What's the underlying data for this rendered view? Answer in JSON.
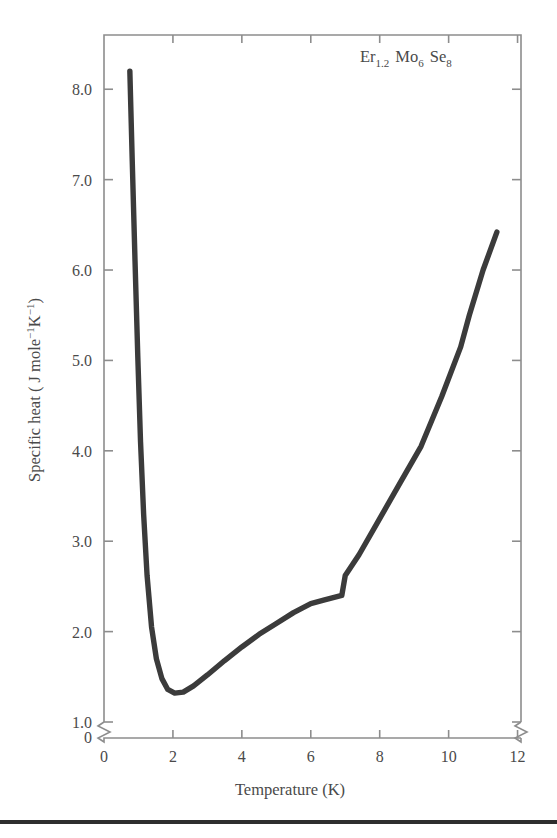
{
  "figure": {
    "annotation": "Er1.2 Mo6 Se8",
    "annotation_parts": {
      "e1": "Er",
      "e1_sub": "1.2",
      "e2": "Mo",
      "e2_sub": "6",
      "e3": "Se",
      "e3_sub": "8"
    }
  },
  "axes": {
    "x_title": "Temperature (K)",
    "y_title_main": "Specific heat ( J mole",
    "y_title_sup1": "−1",
    "y_title_mid": "K",
    "y_title_sup2": "−1",
    "y_title_end": ")",
    "x_tick_labels": [
      "0",
      "2",
      "4",
      "6",
      "8",
      "10",
      "12"
    ],
    "y_tick_labels": [
      "0",
      "1.0",
      "2.0",
      "3.0",
      "4.0",
      "5.0",
      "6.0",
      "7.0",
      "8.0"
    ],
    "y_break_between": [
      "0",
      "1.0"
    ],
    "x_break_note": "right axis break near 12"
  },
  "colors": {
    "curve": "#3b3b3b",
    "frame": "#8d8d8d",
    "text": "#4a4a4a",
    "rule": "#2e2e2e",
    "background": "#ffffff"
  },
  "chart_data": {
    "type": "line",
    "title": "",
    "subtitle": "",
    "xlabel": "Temperature (K)",
    "ylabel": "Specific heat ( J mole−1K−1)",
    "xlim": [
      0,
      12.1
    ],
    "ylim": [
      1.0,
      8.6
    ],
    "y_axis_broken_at": 1.0,
    "y_axis_origin_label": "0",
    "grid": false,
    "legend": false,
    "annotations": [
      {
        "text": "Er1.2 Mo6 Se8",
        "x": 9.3,
        "y": 8.45
      }
    ],
    "xticks": [
      0,
      2,
      4,
      6,
      8,
      10,
      12
    ],
    "yticks": [
      1.0,
      2.0,
      3.0,
      4.0,
      5.0,
      6.0,
      7.0,
      8.0
    ],
    "series": [
      {
        "name": "Er1.2Mo6Se8 specific heat",
        "x": [
          0.75,
          0.82,
          0.9,
          0.98,
          1.06,
          1.15,
          1.25,
          1.38,
          1.52,
          1.68,
          1.85,
          2.05,
          2.3,
          2.6,
          3.0,
          3.5,
          4.0,
          4.5,
          5.0,
          5.5,
          6.0,
          6.4,
          6.9,
          7.0,
          7.4,
          8.0,
          8.6,
          9.2,
          9.8,
          10.35,
          10.6,
          11.0,
          11.4
        ],
        "y": [
          8.2,
          7.2,
          6.1,
          5.05,
          4.1,
          3.3,
          2.62,
          2.05,
          1.7,
          1.48,
          1.36,
          1.32,
          1.33,
          1.4,
          1.52,
          1.68,
          1.83,
          1.97,
          2.09,
          2.21,
          2.31,
          2.35,
          2.4,
          2.62,
          2.85,
          3.25,
          3.65,
          4.05,
          4.6,
          5.15,
          5.5,
          6.0,
          6.42
        ]
      }
    ]
  }
}
